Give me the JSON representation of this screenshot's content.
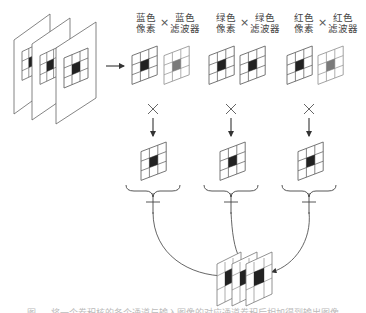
{
  "diagram": {
    "type": "cnn-color-channel-convolution",
    "input": {
      "label": "stacked RGB channel frames",
      "frames": 3,
      "grid": "3x3"
    },
    "channels": [
      {
        "id": "blue",
        "pixel_label_line1": "蓝色",
        "pixel_label_line2": "像素",
        "filter_label_line1": "蓝色",
        "filter_label_line2": "滤波器",
        "operator": "×"
      },
      {
        "id": "green",
        "pixel_label_line1": "绿色",
        "pixel_label_line2": "像素",
        "filter_label_line1": "绿色",
        "filter_label_line2": "滤波器",
        "operator": "×"
      },
      {
        "id": "red",
        "pixel_label_line1": "红色",
        "pixel_label_line2": "像素",
        "filter_label_line1": "红色",
        "filter_label_line2": "滤波器",
        "operator": "×"
      }
    ],
    "multiply_symbol": "×",
    "sum_symbol": "+",
    "output": {
      "label": "stacked output feature maps",
      "frames": 3
    },
    "caption": "图 … 将一个卷积核的各个通道与输入图像的对应通道卷积后相加得到输出图像"
  },
  "colors": {
    "line": "#555555",
    "pixel_active": "#222222",
    "filter_active": "#777777",
    "grid": "#666666",
    "filter_grid": "#999999"
  }
}
